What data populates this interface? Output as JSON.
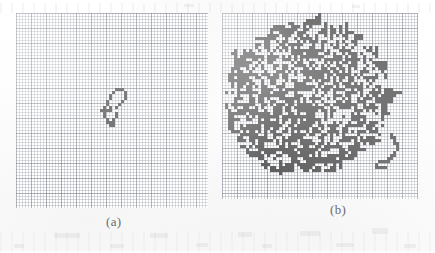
{
  "figure": {
    "kind": "lattice-cluster-figure",
    "medium": "scanned graph paper",
    "background_color": "#fefefe",
    "grid_line_color": "#6e7480",
    "cell_color": "#5a5a5a",
    "caption_color": "#6b6b6b",
    "cell_size_px": 3,
    "major_grid_every": 5
  },
  "panels": [
    {
      "id": "panel-a",
      "caption": "(a)",
      "caption_x": 106,
      "caption_y": 214,
      "grid": {
        "x": 16,
        "y": 13,
        "width": 192,
        "height": 195,
        "cols": 64,
        "rows": 65
      },
      "cluster": {
        "name": "small-cluster",
        "description": "small compact lattice cluster near the centre of the grid",
        "filled_cell_count": 26,
        "bounding_box_cells": {
          "col_min": 28,
          "col_max": 38,
          "row_min": 25,
          "row_max": 39
        },
        "cells": [
          [
            33,
            25
          ],
          [
            34,
            25
          ],
          [
            35,
            25
          ],
          [
            32,
            26
          ],
          [
            36,
            26
          ],
          [
            31,
            27
          ],
          [
            36,
            27
          ],
          [
            31,
            28
          ],
          [
            36,
            28
          ],
          [
            30,
            29
          ],
          [
            35,
            29
          ],
          [
            30,
            30
          ],
          [
            34,
            30
          ],
          [
            29,
            31
          ],
          [
            31,
            31
          ],
          [
            33,
            31
          ],
          [
            28,
            32
          ],
          [
            29,
            32
          ],
          [
            30,
            32
          ],
          [
            31,
            32
          ],
          [
            29,
            33
          ],
          [
            33,
            33
          ],
          [
            29,
            34
          ],
          [
            33,
            34
          ],
          [
            30,
            35
          ],
          [
            32,
            35
          ],
          [
            30,
            36
          ],
          [
            31,
            36
          ],
          [
            32,
            36
          ],
          [
            31,
            37
          ],
          [
            32,
            37
          ]
        ]
      }
    },
    {
      "id": "panel-b",
      "caption": "(b)",
      "caption_x": 330,
      "caption_y": 202,
      "grid": {
        "x": 222,
        "y": 13,
        "width": 196,
        "height": 186,
        "cols": 65,
        "rows": 62
      },
      "cluster": {
        "name": "large-cluster",
        "description": "large dense ramified lattice cluster filling most of the grid",
        "filled_cell_count": 560,
        "bounding_box_cells": {
          "col_min": 5,
          "col_max": 62,
          "row_min": 3,
          "row_max": 57
        },
        "seed": 20240117,
        "generation": {
          "type": "diffusion-limited-style-blob",
          "center_col": 30,
          "center_row": 26,
          "radius_cols": 27,
          "radius_rows": 25,
          "fill_probability": 0.47,
          "tail_cells": [
            [
              56,
              40
            ],
            [
              56,
              41
            ],
            [
              57,
              41
            ],
            [
              57,
              42
            ],
            [
              57,
              43
            ],
            [
              58,
              43
            ],
            [
              58,
              44
            ],
            [
              58,
              45
            ],
            [
              57,
              46
            ],
            [
              57,
              47
            ],
            [
              56,
              47
            ],
            [
              56,
              48
            ],
            [
              55,
              48
            ],
            [
              55,
              49
            ],
            [
              54,
              49
            ],
            [
              53,
              49
            ],
            [
              52,
              49
            ],
            [
              51,
              50
            ],
            [
              51,
              51
            ],
            [
              52,
              51
            ],
            [
              53,
              51
            ],
            [
              54,
              51
            ]
          ]
        }
      }
    }
  ],
  "ghost_marks": [
    {
      "x": 54,
      "y": 233,
      "w": 26,
      "h": 5
    },
    {
      "x": 150,
      "y": 233,
      "w": 18,
      "h": 5
    },
    {
      "x": 238,
      "y": 232,
      "w": 14,
      "h": 5
    },
    {
      "x": 300,
      "y": 231,
      "w": 20,
      "h": 5
    },
    {
      "x": 372,
      "y": 228,
      "w": 16,
      "h": 6
    },
    {
      "x": 14,
      "y": 244,
      "w": 10,
      "h": 4
    },
    {
      "x": 110,
      "y": 244,
      "w": 14,
      "h": 4
    },
    {
      "x": 196,
      "y": 243,
      "w": 12,
      "h": 4
    },
    {
      "x": 262,
      "y": 244,
      "w": 10,
      "h": 4
    },
    {
      "x": 336,
      "y": 243,
      "w": 18,
      "h": 4
    },
    {
      "x": 404,
      "y": 244,
      "w": 12,
      "h": 4
    },
    {
      "x": 184,
      "y": 4,
      "w": 10,
      "h": 3
    },
    {
      "x": 352,
      "y": 5,
      "w": 8,
      "h": 3
    }
  ]
}
